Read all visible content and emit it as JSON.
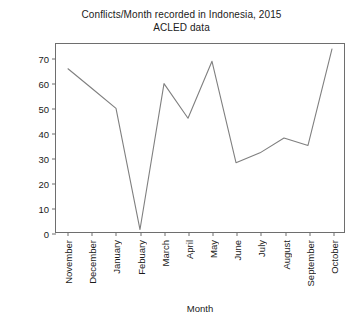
{
  "chart_data": {
    "type": "line",
    "title": "Conflicts/Month recorded in Indonesia, 2015",
    "subtitle": "ACLED data",
    "xlabel": "Month",
    "ylabel": "Number of recorded conflicts",
    "categories": [
      "November",
      "December",
      "January",
      "Febuary",
      "March",
      "April",
      "May",
      "June",
      "July",
      "August",
      "September",
      "October"
    ],
    "values": [
      66,
      58,
      50,
      1,
      60,
      46,
      69,
      28,
      32,
      38,
      35,
      74
    ],
    "ylim": [
      0,
      76
    ],
    "yticks": [
      0,
      10,
      20,
      30,
      40,
      50,
      60,
      70
    ],
    "grid": false,
    "legend": false,
    "line_color": "#7f7f7f",
    "frame_color": "#6e6e6e",
    "background": "#ffffff"
  }
}
